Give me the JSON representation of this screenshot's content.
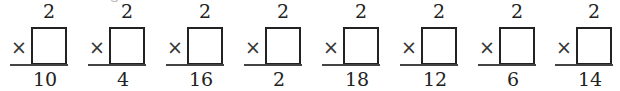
{
  "worksheet": {
    "operator": "×",
    "problems": [
      {
        "top": "2",
        "bottom": "10"
      },
      {
        "top": "2",
        "bottom": "4"
      },
      {
        "top": "2",
        "bottom": "16"
      },
      {
        "top": "2",
        "bottom": "2"
      },
      {
        "top": "2",
        "bottom": "18"
      },
      {
        "top": "2",
        "bottom": "12"
      },
      {
        "top": "2",
        "bottom": "6"
      },
      {
        "top": "2",
        "bottom": "14"
      }
    ]
  }
}
